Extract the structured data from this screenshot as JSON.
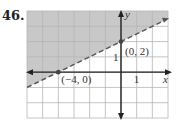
{
  "problem_number": "46.",
  "chart_data": {
    "type": "line",
    "title": "",
    "xlabel": "x",
    "ylabel": "y",
    "xlim": [
      -6,
      3
    ],
    "ylim": [
      -3,
      4
    ],
    "grid": true,
    "series": [
      {
        "name": "boundary y = x/2 + 2",
        "style": "dashed",
        "x": [
          -6,
          3
        ],
        "y": [
          -1,
          3.5
        ]
      }
    ],
    "shaded_region": "above line (y > x/2 + 2)",
    "points": [
      {
        "label": "(−4, 0)",
        "x": -4,
        "y": 0
      },
      {
        "label": "(0, 2)",
        "x": 0,
        "y": 2
      }
    ],
    "tick_labels": {
      "x": [
        "1"
      ],
      "y": [
        "1"
      ]
    }
  },
  "colors": {
    "shade": "#c8c8c8",
    "grid": "#b5b5b5",
    "axis": "#222222",
    "line": "#555555"
  }
}
